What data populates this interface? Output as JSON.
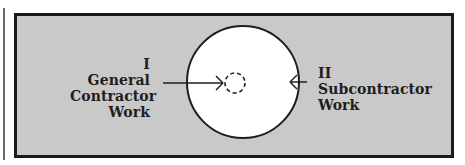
{
  "diagram": {
    "left_label": {
      "numeral": "I",
      "line1": "General",
      "line2": "Contractor",
      "line3": "Work"
    },
    "right_label": {
      "numeral": "II",
      "line1": "Subcontractor",
      "line2": "Work"
    },
    "colors": {
      "background": "#c9c9c9",
      "border": "#1a1a1a",
      "circle_fill": "#ffffff",
      "stroke": "#1e1e1e"
    },
    "shapes": {
      "outer_circle": "solid white circle",
      "inner_circle": "small dashed circle at center",
      "left_arrow": "arrow from left label pointing inward to inner circle",
      "right_arrow": "arrow from right label pointing to outer circle edge"
    }
  }
}
